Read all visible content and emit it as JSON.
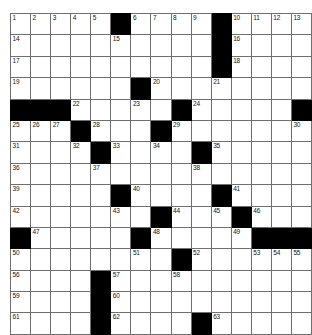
{
  "puzzle": {
    "title": "Crossword Puzzle Grid",
    "rows": 15,
    "cols": 15,
    "colors": {
      "block": "#000000",
      "cell": "#ffffff",
      "grid_line": "#6f6f6f",
      "number_text": "#111111"
    },
    "grid": [
      [
        {
          "type": "white",
          "number": "1"
        },
        {
          "type": "white",
          "number": "2"
        },
        {
          "type": "white",
          "number": "3"
        },
        {
          "type": "white",
          "number": "4"
        },
        {
          "type": "white",
          "number": "5"
        },
        {
          "type": "block",
          "number": ""
        },
        {
          "type": "white",
          "number": "6"
        },
        {
          "type": "white",
          "number": "7"
        },
        {
          "type": "white",
          "number": "8"
        },
        {
          "type": "white",
          "number": "9"
        },
        {
          "type": "block",
          "number": ""
        },
        {
          "type": "white",
          "number": "10"
        },
        {
          "type": "white",
          "number": "11"
        },
        {
          "type": "white",
          "number": "12"
        },
        {
          "type": "white",
          "number": "13"
        }
      ],
      [
        {
          "type": "white",
          "number": "14"
        },
        {
          "type": "white",
          "number": ""
        },
        {
          "type": "white",
          "number": ""
        },
        {
          "type": "white",
          "number": ""
        },
        {
          "type": "white",
          "number": ""
        },
        {
          "type": "white",
          "number": "15"
        },
        {
          "type": "white",
          "number": ""
        },
        {
          "type": "white",
          "number": ""
        },
        {
          "type": "white",
          "number": ""
        },
        {
          "type": "white",
          "number": ""
        },
        {
          "type": "block",
          "number": ""
        },
        {
          "type": "white",
          "number": "16"
        },
        {
          "type": "white",
          "number": ""
        },
        {
          "type": "white",
          "number": ""
        },
        {
          "type": "white",
          "number": ""
        }
      ],
      [
        {
          "type": "white",
          "number": "17"
        },
        {
          "type": "white",
          "number": ""
        },
        {
          "type": "white",
          "number": ""
        },
        {
          "type": "white",
          "number": ""
        },
        {
          "type": "white",
          "number": ""
        },
        {
          "type": "white",
          "number": ""
        },
        {
          "type": "white",
          "number": ""
        },
        {
          "type": "white",
          "number": ""
        },
        {
          "type": "white",
          "number": ""
        },
        {
          "type": "white",
          "number": ""
        },
        {
          "type": "block",
          "number": ""
        },
        {
          "type": "white",
          "number": "18"
        },
        {
          "type": "white",
          "number": ""
        },
        {
          "type": "white",
          "number": ""
        },
        {
          "type": "white",
          "number": ""
        }
      ],
      [
        {
          "type": "white",
          "number": "19"
        },
        {
          "type": "white",
          "number": ""
        },
        {
          "type": "white",
          "number": ""
        },
        {
          "type": "white",
          "number": ""
        },
        {
          "type": "white",
          "number": ""
        },
        {
          "type": "white",
          "number": ""
        },
        {
          "type": "block",
          "number": ""
        },
        {
          "type": "white",
          "number": "20"
        },
        {
          "type": "white",
          "number": ""
        },
        {
          "type": "white",
          "number": ""
        },
        {
          "type": "white",
          "number": "21"
        },
        {
          "type": "white",
          "number": ""
        },
        {
          "type": "white",
          "number": ""
        },
        {
          "type": "white",
          "number": ""
        },
        {
          "type": "white",
          "number": ""
        }
      ],
      [
        {
          "type": "block",
          "number": ""
        },
        {
          "type": "block",
          "number": ""
        },
        {
          "type": "block",
          "number": ""
        },
        {
          "type": "white",
          "number": "22"
        },
        {
          "type": "white",
          "number": ""
        },
        {
          "type": "white",
          "number": ""
        },
        {
          "type": "white",
          "number": "23"
        },
        {
          "type": "white",
          "number": ""
        },
        {
          "type": "block",
          "number": ""
        },
        {
          "type": "white",
          "number": "24"
        },
        {
          "type": "white",
          "number": ""
        },
        {
          "type": "white",
          "number": ""
        },
        {
          "type": "white",
          "number": ""
        },
        {
          "type": "white",
          "number": ""
        },
        {
          "type": "block",
          "number": ""
        }
      ],
      [
        {
          "type": "white",
          "number": "25"
        },
        {
          "type": "white",
          "number": "26"
        },
        {
          "type": "white",
          "number": "27"
        },
        {
          "type": "block",
          "number": ""
        },
        {
          "type": "white",
          "number": "28"
        },
        {
          "type": "white",
          "number": ""
        },
        {
          "type": "white",
          "number": ""
        },
        {
          "type": "block",
          "number": ""
        },
        {
          "type": "white",
          "number": "29"
        },
        {
          "type": "white",
          "number": ""
        },
        {
          "type": "white",
          "number": ""
        },
        {
          "type": "white",
          "number": ""
        },
        {
          "type": "white",
          "number": ""
        },
        {
          "type": "white",
          "number": ""
        },
        {
          "type": "white",
          "number": "30"
        }
      ],
      [
        {
          "type": "white",
          "number": "31"
        },
        {
          "type": "white",
          "number": ""
        },
        {
          "type": "white",
          "number": ""
        },
        {
          "type": "white",
          "number": "32"
        },
        {
          "type": "block",
          "number": ""
        },
        {
          "type": "white",
          "number": "33"
        },
        {
          "type": "white",
          "number": ""
        },
        {
          "type": "white",
          "number": "34"
        },
        {
          "type": "white",
          "number": ""
        },
        {
          "type": "block",
          "number": ""
        },
        {
          "type": "white",
          "number": "35"
        },
        {
          "type": "white",
          "number": ""
        },
        {
          "type": "white",
          "number": ""
        },
        {
          "type": "white",
          "number": ""
        },
        {
          "type": "white",
          "number": ""
        }
      ],
      [
        {
          "type": "white",
          "number": "36"
        },
        {
          "type": "white",
          "number": ""
        },
        {
          "type": "white",
          "number": ""
        },
        {
          "type": "white",
          "number": ""
        },
        {
          "type": "white",
          "number": "37"
        },
        {
          "type": "white",
          "number": ""
        },
        {
          "type": "white",
          "number": ""
        },
        {
          "type": "white",
          "number": ""
        },
        {
          "type": "white",
          "number": ""
        },
        {
          "type": "white",
          "number": "38"
        },
        {
          "type": "white",
          "number": ""
        },
        {
          "type": "white",
          "number": ""
        },
        {
          "type": "white",
          "number": ""
        },
        {
          "type": "white",
          "number": ""
        },
        {
          "type": "white",
          "number": ""
        }
      ],
      [
        {
          "type": "white",
          "number": "39"
        },
        {
          "type": "white",
          "number": ""
        },
        {
          "type": "white",
          "number": ""
        },
        {
          "type": "white",
          "number": ""
        },
        {
          "type": "white",
          "number": ""
        },
        {
          "type": "block",
          "number": ""
        },
        {
          "type": "white",
          "number": "40"
        },
        {
          "type": "white",
          "number": ""
        },
        {
          "type": "white",
          "number": ""
        },
        {
          "type": "white",
          "number": ""
        },
        {
          "type": "block",
          "number": ""
        },
        {
          "type": "white",
          "number": "41"
        },
        {
          "type": "white",
          "number": ""
        },
        {
          "type": "white",
          "number": ""
        },
        {
          "type": "white",
          "number": ""
        }
      ],
      [
        {
          "type": "white",
          "number": "42"
        },
        {
          "type": "white",
          "number": ""
        },
        {
          "type": "white",
          "number": ""
        },
        {
          "type": "white",
          "number": ""
        },
        {
          "type": "white",
          "number": ""
        },
        {
          "type": "white",
          "number": "43"
        },
        {
          "type": "white",
          "number": ""
        },
        {
          "type": "block",
          "number": ""
        },
        {
          "type": "white",
          "number": "44"
        },
        {
          "type": "white",
          "number": ""
        },
        {
          "type": "white",
          "number": "45"
        },
        {
          "type": "block",
          "number": ""
        },
        {
          "type": "white",
          "number": "46"
        },
        {
          "type": "white",
          "number": ""
        },
        {
          "type": "white",
          "number": ""
        }
      ],
      [
        {
          "type": "block",
          "number": ""
        },
        {
          "type": "white",
          "number": "47"
        },
        {
          "type": "white",
          "number": ""
        },
        {
          "type": "white",
          "number": ""
        },
        {
          "type": "white",
          "number": ""
        },
        {
          "type": "white",
          "number": ""
        },
        {
          "type": "block",
          "number": ""
        },
        {
          "type": "white",
          "number": "48"
        },
        {
          "type": "white",
          "number": ""
        },
        {
          "type": "white",
          "number": ""
        },
        {
          "type": "white",
          "number": ""
        },
        {
          "type": "white",
          "number": "49"
        },
        {
          "type": "block",
          "number": ""
        },
        {
          "type": "block",
          "number": ""
        },
        {
          "type": "block",
          "number": ""
        }
      ],
      [
        {
          "type": "white",
          "number": "50"
        },
        {
          "type": "white",
          "number": ""
        },
        {
          "type": "white",
          "number": ""
        },
        {
          "type": "white",
          "number": ""
        },
        {
          "type": "white",
          "number": ""
        },
        {
          "type": "white",
          "number": ""
        },
        {
          "type": "white",
          "number": "51"
        },
        {
          "type": "white",
          "number": ""
        },
        {
          "type": "block",
          "number": ""
        },
        {
          "type": "white",
          "number": "52"
        },
        {
          "type": "white",
          "number": ""
        },
        {
          "type": "white",
          "number": ""
        },
        {
          "type": "white",
          "number": "53"
        },
        {
          "type": "white",
          "number": "54"
        },
        {
          "type": "white",
          "number": "55"
        }
      ],
      [
        {
          "type": "white",
          "number": "56"
        },
        {
          "type": "white",
          "number": ""
        },
        {
          "type": "white",
          "number": ""
        },
        {
          "type": "white",
          "number": ""
        },
        {
          "type": "block",
          "number": ""
        },
        {
          "type": "white",
          "number": "57"
        },
        {
          "type": "white",
          "number": ""
        },
        {
          "type": "white",
          "number": ""
        },
        {
          "type": "white",
          "number": "58"
        },
        {
          "type": "white",
          "number": ""
        },
        {
          "type": "white",
          "number": ""
        },
        {
          "type": "white",
          "number": ""
        },
        {
          "type": "white",
          "number": ""
        },
        {
          "type": "white",
          "number": ""
        },
        {
          "type": "white",
          "number": ""
        }
      ],
      [
        {
          "type": "white",
          "number": "59"
        },
        {
          "type": "white",
          "number": ""
        },
        {
          "type": "white",
          "number": ""
        },
        {
          "type": "white",
          "number": ""
        },
        {
          "type": "block",
          "number": ""
        },
        {
          "type": "white",
          "number": "60"
        },
        {
          "type": "white",
          "number": ""
        },
        {
          "type": "white",
          "number": ""
        },
        {
          "type": "white",
          "number": ""
        },
        {
          "type": "white",
          "number": ""
        },
        {
          "type": "white",
          "number": ""
        },
        {
          "type": "white",
          "number": ""
        },
        {
          "type": "white",
          "number": ""
        },
        {
          "type": "white",
          "number": ""
        },
        {
          "type": "white",
          "number": ""
        }
      ],
      [
        {
          "type": "white",
          "number": "61"
        },
        {
          "type": "white",
          "number": ""
        },
        {
          "type": "white",
          "number": ""
        },
        {
          "type": "white",
          "number": ""
        },
        {
          "type": "block",
          "number": ""
        },
        {
          "type": "white",
          "number": "62"
        },
        {
          "type": "white",
          "number": ""
        },
        {
          "type": "white",
          "number": ""
        },
        {
          "type": "white",
          "number": ""
        },
        {
          "type": "block",
          "number": ""
        },
        {
          "type": "white",
          "number": "63"
        },
        {
          "type": "white",
          "number": ""
        },
        {
          "type": "white",
          "number": ""
        },
        {
          "type": "white",
          "number": ""
        },
        {
          "type": "white",
          "number": ""
        }
      ]
    ]
  }
}
